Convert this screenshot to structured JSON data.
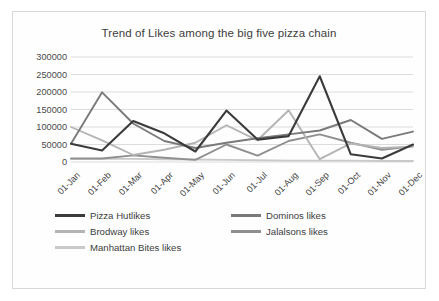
{
  "chart_data": {
    "type": "line",
    "title": "Trend of Likes among the big five pizza chain",
    "xlabel": "",
    "ylabel": "",
    "ylim": [
      0,
      300000
    ],
    "ytick_step": 50000,
    "yticks": [
      "300000",
      "250000",
      "200000",
      "150000",
      "100000",
      "50000",
      "0"
    ],
    "grid": true,
    "legend_position": "bottom",
    "categories": [
      "01-Jan",
      "01-Feb",
      "01-Mar",
      "01-Apr",
      "01-May",
      "01-Jun",
      "01-Jul",
      "01-Aug",
      "01-Sep",
      "01-Oct",
      "01-Nov",
      "01-Dec"
    ],
    "series": [
      {
        "name": "Pizza Hutlikes",
        "color": "#3b3b3b",
        "values": [
          52000,
          33000,
          117000,
          82000,
          30000,
          147000,
          64000,
          74000,
          245000,
          22000,
          10000,
          50000
        ]
      },
      {
        "name": "Dominos likes",
        "color": "#7a7a7a",
        "values": [
          52000,
          199000,
          110000,
          60000,
          40000,
          55000,
          68000,
          79000,
          90000,
          120000,
          66000,
          87000
        ]
      },
      {
        "name": "Brodway likes",
        "color": "#b4b4b4",
        "values": [
          100000,
          62000,
          20000,
          35000,
          55000,
          105000,
          62000,
          148000,
          8000,
          53000,
          40000,
          44000
        ]
      },
      {
        "name": "Jalalsons likes",
        "color": "#8f8f8f",
        "values": [
          10000,
          10000,
          19000,
          12000,
          6000,
          50000,
          18000,
          60000,
          79000,
          55000,
          35000,
          45000
        ]
      },
      {
        "name": "Manhattan Bites likes",
        "color": "#c9c9c9",
        "values": [
          9000,
          9000,
          9000,
          8000,
          7000,
          6000,
          5000,
          4000,
          4000,
          4000,
          3000,
          3000
        ]
      }
    ]
  }
}
